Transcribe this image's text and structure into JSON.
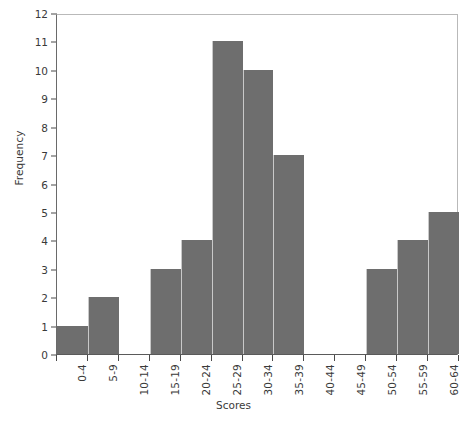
{
  "chart_data": {
    "type": "bar",
    "title": "",
    "subtitle": "",
    "xlabel": "Scores",
    "ylabel": "Frequency",
    "categories": [
      "0-4",
      "5-9",
      "10-14",
      "15-19",
      "20-24",
      "25-29",
      "30-34",
      "35-39",
      "40-44",
      "45-49",
      "50-54",
      "55-59",
      "60-64"
    ],
    "values": [
      1,
      2,
      0,
      3,
      4,
      11,
      10,
      7,
      0,
      0,
      3,
      4,
      5
    ],
    "ylim": [
      0,
      12
    ],
    "yticks": [
      0,
      1,
      2,
      3,
      4,
      5,
      6,
      7,
      8,
      9,
      10,
      11,
      12
    ],
    "ytick_labels": [
      "0",
      "1",
      "2",
      "3",
      "4",
      "5",
      "6",
      "7",
      "8",
      "9",
      "10",
      "11",
      "12"
    ],
    "grid": false,
    "legend": null,
    "bar_color": "#6e6e6e",
    "bar_separator_color": "#c9c9c9",
    "axis_color": "#5a5a5a",
    "frame_color": "#b9b9b9"
  }
}
